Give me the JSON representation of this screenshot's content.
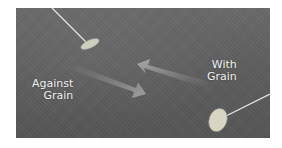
{
  "figure": {
    "labels": {
      "against": [
        "Against",
        "Grain"
      ],
      "with": [
        "With",
        "Grain"
      ]
    },
    "colors": {
      "grass": "#5f5f5f",
      "arrow": "#9a9a9a",
      "text": "#f2f2f2"
    }
  }
}
